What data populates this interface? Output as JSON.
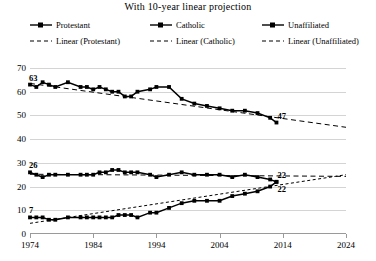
{
  "title": "With 10-year linear projection",
  "legend": {
    "position": "top",
    "items": [
      {
        "label": "Protestant",
        "style": "solid-marker",
        "icon": "line-marker-icon"
      },
      {
        "label": "Catholic",
        "style": "solid-marker",
        "icon": "line-marker-icon"
      },
      {
        "label": "Unaffiliated",
        "style": "solid-marker",
        "icon": "line-marker-icon"
      },
      {
        "label": "Linear (Protestant)",
        "style": "dashed",
        "icon": "dashed-line-icon"
      },
      {
        "label": "Linear (Catholic)",
        "style": "dashed",
        "icon": "dashed-line-icon"
      },
      {
        "label": "Linear (Unaffiliated)",
        "style": "dashed",
        "icon": "dashed-line-icon"
      }
    ]
  },
  "annotations": [
    {
      "text": "63",
      "series": "Protestant",
      "x": 1974,
      "y": 63,
      "anchor": "start"
    },
    {
      "text": "47",
      "series": "Protestant",
      "x": 2013,
      "y": 47,
      "anchor": "end"
    },
    {
      "text": "26",
      "series": "Catholic",
      "x": 1974,
      "y": 26,
      "anchor": "start"
    },
    {
      "text": "22",
      "series": "Catholic",
      "x": 2013,
      "y": 22,
      "anchor": "end"
    },
    {
      "text": "7",
      "series": "Unaffiliated",
      "x": 1974,
      "y": 7,
      "anchor": "start"
    },
    {
      "text": "22",
      "series": "Unaffiliated",
      "x": 2013,
      "y": 22,
      "anchor": "end"
    }
  ],
  "colors": {
    "series": "#000000",
    "gridline": "#d4d4d4",
    "axis": "#9a9a9a",
    "background": "#ffffff"
  },
  "chart_data": {
    "type": "line",
    "title": "With 10-year linear projection",
    "xlabel": "",
    "ylabel": "",
    "xlim": [
      1974,
      2024
    ],
    "ylim": [
      0,
      70
    ],
    "yticks": [
      0,
      10,
      20,
      30,
      40,
      50,
      60,
      70
    ],
    "xticks": [
      1974,
      1984,
      1994,
      2004,
      2014,
      2024
    ],
    "grid": true,
    "legend_position": "top",
    "x": [
      1974,
      1975,
      1976,
      1977,
      1978,
      1980,
      1982,
      1983,
      1984,
      1985,
      1986,
      1987,
      1988,
      1989,
      1990,
      1991,
      1993,
      1994,
      1996,
      1998,
      2000,
      2002,
      2004,
      2006,
      2008,
      2010,
      2012,
      2013
    ],
    "series": [
      {
        "name": "Protestant",
        "style": "solid",
        "marker": "square",
        "values": [
          63,
          62,
          64,
          63,
          62,
          64,
          62,
          62,
          61,
          62,
          61,
          60,
          60,
          58,
          58,
          60,
          61,
          62,
          62,
          57,
          55,
          54,
          53,
          52,
          52,
          51,
          49,
          47
        ]
      },
      {
        "name": "Catholic",
        "style": "solid",
        "marker": "square",
        "values": [
          26,
          25,
          24,
          25,
          25,
          25,
          25,
          25,
          25,
          26,
          26,
          27,
          27,
          26,
          26,
          26,
          25,
          24,
          25,
          26,
          25,
          25,
          25,
          24,
          25,
          24,
          23,
          22
        ]
      },
      {
        "name": "Unaffiliated",
        "style": "solid",
        "marker": "square",
        "values": [
          7,
          7,
          7,
          6,
          6,
          7,
          7,
          7,
          7,
          7,
          7,
          7,
          8,
          8,
          8,
          7,
          9,
          9,
          11,
          13,
          14,
          14,
          14,
          16,
          17,
          18,
          20,
          22
        ]
      },
      {
        "name": "Linear (Protestant)",
        "style": "dashed",
        "projection": true,
        "x": [
          1974,
          2024
        ],
        "values": [
          63.5,
          45.0
        ]
      },
      {
        "name": "Linear (Catholic)",
        "style": "dashed",
        "projection": true,
        "x": [
          1974,
          2024
        ],
        "values": [
          25.2,
          24.3
        ]
      },
      {
        "name": "Linear (Unaffiliated)",
        "style": "dashed",
        "projection": true,
        "x": [
          1974,
          2024
        ],
        "values": [
          4.5,
          25.0
        ]
      }
    ]
  }
}
